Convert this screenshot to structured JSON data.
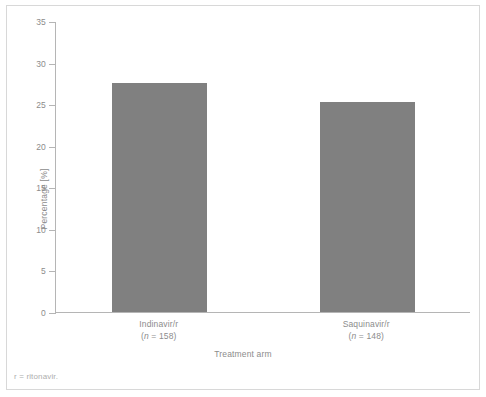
{
  "figure": {
    "footnote": "r = ritonavir.",
    "bar_color": "#808080",
    "axis_color": "#b5b5b5",
    "text_color": "#8c8c8c",
    "frame_color": "#d8d8d8"
  },
  "chart_data": {
    "type": "bar",
    "title": "",
    "xlabel": "Treatment arm",
    "ylabel": "Percentage [%]",
    "categories": [
      "Indinavir/r",
      "Saquinavir/r"
    ],
    "category_sublabels": [
      "(n = 158)",
      "(n = 148)"
    ],
    "category_n": [
      158,
      148
    ],
    "values": [
      27.5,
      25.2
    ],
    "ylim": [
      0,
      35
    ],
    "yticks": [
      0,
      5,
      10,
      15,
      20,
      25,
      30,
      35
    ],
    "ytick_labels": [
      "0",
      "5",
      "10",
      "15",
      "20",
      "25",
      "30",
      "35"
    ],
    "grid": false,
    "legend": "none"
  }
}
